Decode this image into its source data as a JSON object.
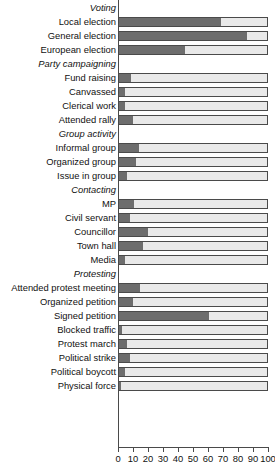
{
  "chart_data": {
    "type": "bar",
    "orientation": "horizontal",
    "stacked": true,
    "title": "",
    "xlabel": "",
    "ylabel": "",
    "xlim": [
      0,
      100
    ],
    "xticks": [
      0,
      10,
      20,
      30,
      40,
      50,
      60,
      70,
      80,
      90,
      100
    ],
    "xtick_labels": [
      "0",
      "10",
      "20",
      "30",
      "40",
      "50",
      "60",
      "70",
      "80",
      "90",
      "100"
    ],
    "grid": false,
    "legend": "none",
    "colors": {
      "filled": "#6d6d6d",
      "remainder": "#e9e9e9",
      "outline": "#4a4a4a"
    },
    "sections": [
      "Voting",
      "Party campaigning",
      "Group activity",
      "Contacting",
      "Protesting"
    ],
    "categories": [
      "Voting",
      "Local election",
      "General election",
      "European election",
      "Party campaigning",
      "Fund raising",
      "Canvassed",
      "Clerical work",
      "Attended rally",
      "Group activity",
      "Informal group",
      "Organized group",
      "Issue in group",
      "Contacting",
      "MP",
      "Civil servant",
      "Councillor",
      "Town hall",
      "Media",
      "Protesting",
      "Attended protest meeting",
      "Organized petition",
      "Signed petition",
      "Blocked traffic",
      "Protest march",
      "Political strike",
      "Political boycott",
      "Physical force"
    ],
    "values": [
      null,
      68,
      85,
      44,
      null,
      8,
      4,
      4,
      9,
      null,
      13,
      11,
      5,
      null,
      10,
      7,
      19,
      16,
      4,
      null,
      14,
      9,
      60,
      2,
      5,
      7,
      4,
      1
    ]
  },
  "rows": [
    {
      "label": "Voting",
      "header": true,
      "value": null,
      "total": null
    },
    {
      "label": "Local election",
      "header": false,
      "value": 68,
      "total": 100
    },
    {
      "label": "General election",
      "header": false,
      "value": 85,
      "total": 100
    },
    {
      "label": "European election",
      "header": false,
      "value": 44,
      "total": 100
    },
    {
      "label": "Party campaigning",
      "header": true,
      "value": null,
      "total": null
    },
    {
      "label": "Fund raising",
      "header": false,
      "value": 8,
      "total": 100
    },
    {
      "label": "Canvassed",
      "header": false,
      "value": 4,
      "total": 100
    },
    {
      "label": "Clerical work",
      "header": false,
      "value": 4,
      "total": 100
    },
    {
      "label": "Attended rally",
      "header": false,
      "value": 9,
      "total": 100
    },
    {
      "label": "Group activity",
      "header": true,
      "value": null,
      "total": null
    },
    {
      "label": "Informal group",
      "header": false,
      "value": 13,
      "total": 100
    },
    {
      "label": "Organized group",
      "header": false,
      "value": 11,
      "total": 100
    },
    {
      "label": "Issue in group",
      "header": false,
      "value": 5,
      "total": 100
    },
    {
      "label": "Contacting",
      "header": true,
      "value": null,
      "total": null
    },
    {
      "label": "MP",
      "header": false,
      "value": 10,
      "total": 100
    },
    {
      "label": "Civil servant",
      "header": false,
      "value": 7,
      "total": 100
    },
    {
      "label": "Councillor",
      "header": false,
      "value": 19,
      "total": 100
    },
    {
      "label": "Town hall",
      "header": false,
      "value": 16,
      "total": 100
    },
    {
      "label": "Media",
      "header": false,
      "value": 4,
      "total": 100
    },
    {
      "label": "Protesting",
      "header": true,
      "value": null,
      "total": null
    },
    {
      "label": "Attended protest meeting",
      "header": false,
      "value": 14,
      "total": 100
    },
    {
      "label": "Organized petition",
      "header": false,
      "value": 9,
      "total": 100
    },
    {
      "label": "Signed petition",
      "header": false,
      "value": 60,
      "total": 100
    },
    {
      "label": "Blocked traffic",
      "header": false,
      "value": 2,
      "total": 100
    },
    {
      "label": "Protest march",
      "header": false,
      "value": 5,
      "total": 100
    },
    {
      "label": "Political strike",
      "header": false,
      "value": 7,
      "total": 100
    },
    {
      "label": "Political boycott",
      "header": false,
      "value": 4,
      "total": 100
    },
    {
      "label": "Physical force",
      "header": false,
      "value": 1,
      "total": 100
    }
  ]
}
